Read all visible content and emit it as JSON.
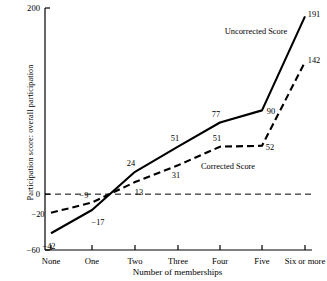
{
  "chart_data": {
    "type": "line",
    "title": "",
    "xlabel": "Number of memberships",
    "ylabel": "Participation score: overall participation",
    "categories": [
      "None",
      "One",
      "Two",
      "Three",
      "Four",
      "Five",
      "Six or more"
    ],
    "ylim": [
      -60,
      200
    ],
    "yticks": [
      200,
      0,
      -60
    ],
    "ytick_labels": [
      "200",
      "0",
      "−60"
    ],
    "grid": false,
    "zero_line": true,
    "legend_position": "inline-annotations",
    "series": [
      {
        "name": "Uncorrected Score",
        "style": "solid",
        "values": [
          -42,
          -17,
          24,
          51,
          77,
          90,
          191
        ],
        "labels": [
          "−42",
          "−17",
          "24",
          "51",
          "77",
          "90",
          "191"
        ]
      },
      {
        "name": "Corrected Score",
        "style": "dashed",
        "values": [
          -20,
          -9,
          13,
          31,
          51,
          52,
          142
        ],
        "labels": [
          "−20",
          "−9",
          "13",
          "31",
          "51",
          "52",
          "142"
        ]
      }
    ],
    "annotations": [
      {
        "text": "Uncorrected Score",
        "x": 256,
        "y": 31
      },
      {
        "text": "Corrected Score",
        "x": 228,
        "y": 166
      }
    ],
    "colors": {
      "line": "#000000",
      "axis": "#000000",
      "zero_line": "#000000"
    }
  },
  "point_label_offsets": {
    "uncorrected": [
      {
        "dx": -2,
        "dy": 13
      },
      {
        "dx": 6,
        "dy": 12
      },
      {
        "dx": -4,
        "dy": -9
      },
      {
        "dx": -3,
        "dy": -9
      },
      {
        "dx": -4,
        "dy": -8
      },
      {
        "dx": 9,
        "dy": 1
      },
      {
        "dx": 9,
        "dy": -2
      }
    ],
    "corrected": [
      {
        "dx": -13,
        "dy": 1
      },
      {
        "dx": -8,
        "dy": -8
      },
      {
        "dx": 4,
        "dy": 10
      },
      {
        "dx": -2,
        "dy": 10
      },
      {
        "dx": -3,
        "dy": -9
      },
      {
        "dx": 8,
        "dy": 1
      },
      {
        "dx": 9,
        "dy": -2
      }
    ]
  }
}
